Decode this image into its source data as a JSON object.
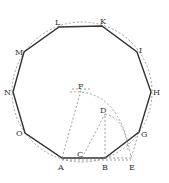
{
  "diagram": {
    "vertices": [
      {
        "id": "A",
        "x": 62,
        "y": 158
      },
      {
        "id": "B",
        "x": 105,
        "y": 158
      },
      {
        "id": "G",
        "x": 139,
        "y": 132
      },
      {
        "id": "H",
        "x": 151,
        "y": 92
      },
      {
        "id": "I",
        "x": 137,
        "y": 52
      },
      {
        "id": "K",
        "x": 102,
        "y": 26
      },
      {
        "id": "L",
        "x": 59,
        "y": 27
      },
      {
        "id": "M",
        "x": 24,
        "y": 52
      },
      {
        "id": "N",
        "x": 13,
        "y": 92
      },
      {
        "id": "O",
        "x": 25,
        "y": 133
      }
    ],
    "construction_points": [
      {
        "id": "C",
        "x": 82,
        "y": 158
      },
      {
        "id": "D",
        "x": 105,
        "y": 114
      },
      {
        "id": "E",
        "x": 131,
        "y": 158
      },
      {
        "id": "F",
        "x": 81,
        "y": 90
      }
    ],
    "labels": {
      "A": "A",
      "B": "B",
      "C": "C",
      "D": "D",
      "E": "E",
      "F": "F",
      "G": "G",
      "H": "H",
      "I": "I",
      "K": "K",
      "L": "L",
      "M": "M",
      "N": "N",
      "O": "O"
    },
    "circumcircle": {
      "cx": 82,
      "cy": 92,
      "r": 70
    }
  }
}
